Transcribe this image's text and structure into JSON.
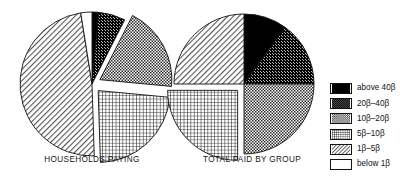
{
  "figure": {
    "background_color": "#ffffff",
    "line_color": "#111111"
  },
  "charts": [
    {
      "id": "households-paying",
      "title": "HOUSEHOLDS PAYING",
      "center": [
        92,
        84
      ],
      "radius": 72
    },
    {
      "id": "total-paid-by-group",
      "title": "TOTAL PAID BY GROUP",
      "center": [
        244,
        84
      ],
      "radius": 70
    }
  ],
  "legend": {
    "position": "right",
    "items": [
      {
        "label": "above 40β",
        "pattern": "solid-black",
        "color": "#000000"
      },
      {
        "label": "20β–40β",
        "pattern": "dark-checker",
        "color": "#4a4a4a"
      },
      {
        "label": "10β–20β",
        "pattern": "medium-checker",
        "color": "#8c8c8c"
      },
      {
        "label": "5β–10β",
        "pattern": "crosshatch",
        "color": "#9a9a9a"
      },
      {
        "label": "1β–5β",
        "pattern": "diagonal-hatch",
        "color": "#c9c9c9"
      },
      {
        "label": "below 1β",
        "pattern": "white",
        "color": "#ffffff"
      }
    ]
  },
  "chart_data": [
    {
      "type": "pie",
      "title": "HOUSEHOLDS PAYING",
      "categories": [
        "above 40β",
        "20β–40β",
        "10β–20β",
        "5β–10β",
        "1β–5β",
        "below 1β"
      ],
      "values": [
        1.5,
        6,
        19,
        23,
        48,
        2.5
      ],
      "units": "percent",
      "start_angle": -90,
      "direction": "clockwise",
      "exploded": [
        "10β–20β",
        "5β–10β"
      ],
      "legend_position": "right",
      "grid": false
    },
    {
      "type": "pie",
      "title": "TOTAL PAID BY GROUP",
      "categories": [
        "above 40β",
        "20β–40β",
        "10β–20β",
        "5β–10β",
        "1β–5β",
        "below 1β"
      ],
      "values": [
        10,
        15,
        25,
        25,
        25,
        0
      ],
      "units": "percent",
      "start_angle": -90,
      "direction": "clockwise",
      "exploded": [
        "5β–10β"
      ],
      "legend_position": "right",
      "grid": false
    }
  ]
}
